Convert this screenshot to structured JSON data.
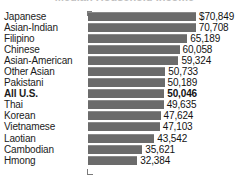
{
  "chart_data": {
    "type": "bar",
    "orientation": "horizontal",
    "title": "Median Household Income",
    "xlabel": "",
    "ylabel": "",
    "grid": false,
    "legend": null,
    "axis_max": 70849,
    "categories": [
      "Japanese",
      "Asian-Indian",
      "Filipino",
      "Chinese",
      "Asian-American",
      "Other Asian",
      "Pakistani",
      "All U.S.",
      "Thai",
      "Korean",
      "Vietnamese",
      "Laotian",
      "Cambodian",
      "Hmong"
    ],
    "values": [
      70849,
      70708,
      65189,
      60058,
      59324,
      50733,
      50189,
      50046,
      49635,
      47624,
      47103,
      43542,
      35621,
      32384
    ],
    "value_labels": [
      "$70,849",
      "70,708",
      "65,189",
      "60,058",
      "59,324",
      "50,733",
      "50,189",
      "50,046",
      "49,635",
      "47,624",
      "47,103",
      "43,542",
      "35,621",
      "32,384"
    ],
    "highlight_index": 7,
    "bar_color": "#6b6b6b",
    "background_color": "#ffffff",
    "text_color": "#1b1b1b"
  }
}
